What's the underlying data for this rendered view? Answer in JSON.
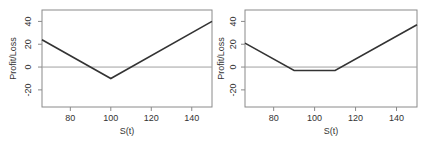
{
  "chart_data": [
    {
      "type": "line",
      "title": "",
      "xlabel": "S(t)",
      "ylabel": "Profit/Loss",
      "xlim": [
        66,
        150
      ],
      "ylim": [
        -35,
        50
      ],
      "xticks": [
        80,
        100,
        120,
        140
      ],
      "xtick_labels": [
        "80",
        "100",
        "120",
        "140"
      ],
      "yticks": [
        -20,
        0,
        20,
        40
      ],
      "ytick_labels": [
        "-20",
        "0",
        "20",
        "40"
      ],
      "grid": false,
      "reference_line": {
        "y": 0
      },
      "series": [
        {
          "name": "payoff",
          "x": [
            66,
            100,
            150
          ],
          "y": [
            24,
            -10,
            40
          ]
        }
      ]
    },
    {
      "type": "line",
      "title": "",
      "xlabel": "S(t)",
      "ylabel": "Profit/Loss",
      "xlim": [
        66,
        150
      ],
      "ylim": [
        -35,
        50
      ],
      "xticks": [
        80,
        100,
        120,
        140
      ],
      "xtick_labels": [
        "80",
        "100",
        "120",
        "140"
      ],
      "yticks": [
        -20,
        0,
        20,
        40
      ],
      "ytick_labels": [
        "-20",
        "0",
        "20",
        "40"
      ],
      "grid": false,
      "reference_line": {
        "y": 0
      },
      "series": [
        {
          "name": "payoff",
          "x": [
            66,
            90,
            110,
            150
          ],
          "y": [
            21,
            -3,
            -3,
            37
          ]
        }
      ]
    }
  ]
}
